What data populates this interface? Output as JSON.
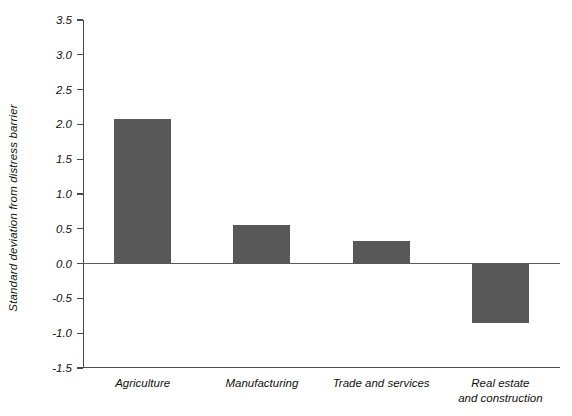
{
  "chart_data": {
    "type": "bar",
    "title": "",
    "xlabel": "",
    "ylabel": "Standard deviation from distress barrier",
    "categories": [
      "Agriculture",
      "Manufacturing",
      "Trade and services",
      "Real estate\nand construction"
    ],
    "values": [
      2.08,
      0.55,
      0.32,
      -0.85
    ],
    "ylim": [
      -1.5,
      3.5
    ],
    "ytick_labels": [
      "3.5",
      "3.0",
      "2.5",
      "2.0",
      "1.5",
      "1.0",
      "0.5",
      "0.0",
      "-0.5",
      "-1.0",
      "-1.5"
    ],
    "ytick_values": [
      3.5,
      3.0,
      2.5,
      2.0,
      1.5,
      1.0,
      0.5,
      0.0,
      -0.5,
      -1.0,
      -1.5
    ],
    "grid": false,
    "legend": null,
    "bar_color": "#585858",
    "axis_color": "#4a4a4a",
    "zero_line_color": "#5a5a5a",
    "background": "#ffffff"
  }
}
